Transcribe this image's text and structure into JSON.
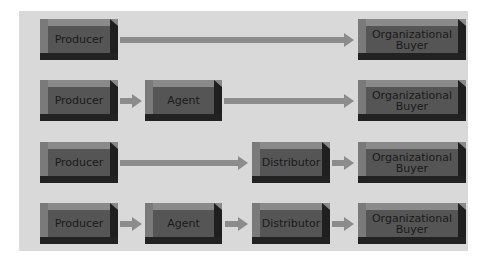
{
  "diagram": {
    "title": "",
    "rows": [
      {
        "nodes": [
          "Producer",
          "Organizational Buyer"
        ]
      },
      {
        "nodes": [
          "Producer",
          "Agent",
          "Organizational Buyer"
        ]
      },
      {
        "nodes": [
          "Producer",
          "Distributor",
          "Organizational Buyer"
        ]
      },
      {
        "nodes": [
          "Producer",
          "Agent",
          "Distributor",
          "Organizational Buyer"
        ]
      }
    ],
    "labels": {
      "producer": "Producer",
      "agent": "Agent",
      "distributor": "Distributor",
      "buyer_line1": "Organizational",
      "buyer_line2": "Buyer"
    },
    "colors": {
      "panel": "#d9d9d9",
      "box_face": "#555555",
      "arrow": "#8c8c8c",
      "text": "#1a1a1a"
    }
  }
}
